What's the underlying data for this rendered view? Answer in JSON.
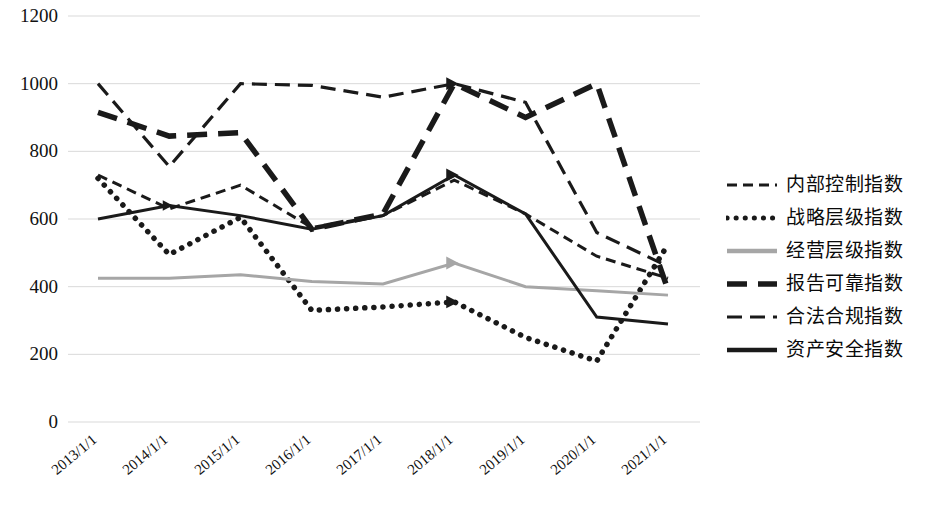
{
  "chart_data": {
    "type": "line",
    "title": "",
    "xlabel": "",
    "ylabel": "",
    "grid": true,
    "legend_position": "right",
    "ylim": [
      0,
      1200
    ],
    "yticks": [
      0,
      200,
      400,
      600,
      800,
      1000,
      1200
    ],
    "ytick_labels": [
      "0",
      "200",
      "400",
      "600",
      "800",
      "1000",
      "1200"
    ],
    "categories": [
      "2013/1/1",
      "2014/1/1",
      "2015/1/1",
      "2016/1/1",
      "2017/1/1",
      "2018/1/1",
      "2019/1/1",
      "2020/1/1",
      "2021/1/1"
    ],
    "series": [
      {
        "name": "内部控制指数",
        "style": "dashed",
        "color": "#1a1a1a",
        "values": [
          730,
          630,
          700,
          575,
          610,
          715,
          615,
          490,
          425
        ]
      },
      {
        "name": "战略层级指数",
        "style": "dotted",
        "color": "#1a1a1a",
        "values": [
          720,
          495,
          605,
          330,
          340,
          355,
          250,
          180,
          525
        ]
      },
      {
        "name": "经营层级指数",
        "style": "solid",
        "color": "#a6a6a6",
        "values": [
          425,
          425,
          435,
          415,
          408,
          470,
          400,
          388,
          375
        ]
      },
      {
        "name": "报告可靠指数",
        "style": "dashed-long",
        "color": "#1a1a1a",
        "values": [
          915,
          845,
          855,
          570,
          615,
          1000,
          900,
          1000,
          390
        ]
      },
      {
        "name": "合法合规指数",
        "style": "dashed-medium",
        "color": "#1a1a1a",
        "values": [
          1000,
          755,
          1000,
          995,
          960,
          1000,
          945,
          560,
          460
        ]
      },
      {
        "name": "资产安全指数",
        "style": "solid",
        "color": "#1a1a1a",
        "values": [
          600,
          640,
          610,
          570,
          610,
          730,
          615,
          310,
          290
        ]
      }
    ]
  },
  "legend": {
    "items": [
      {
        "label": "内部控制指数",
        "style": "dashed"
      },
      {
        "label": "战略层级指数",
        "style": "dotted"
      },
      {
        "label": "经营层级指数",
        "style": "solid-gray"
      },
      {
        "label": "报告可靠指数",
        "style": "dashed-long"
      },
      {
        "label": "合法合规指数",
        "style": "dashed-medium"
      },
      {
        "label": "资产安全指数",
        "style": "solid-black"
      }
    ]
  },
  "axes": {
    "y_tick_labels": [
      "1200",
      "1000",
      "800",
      "600",
      "400",
      "200",
      "0"
    ],
    "x_tick_labels": [
      "2013/1/1",
      "2014/1/1",
      "2015/1/1",
      "2016/1/1",
      "2017/1/1",
      "2018/1/1",
      "2019/1/1",
      "2020/1/1",
      "2021/1/1"
    ]
  }
}
